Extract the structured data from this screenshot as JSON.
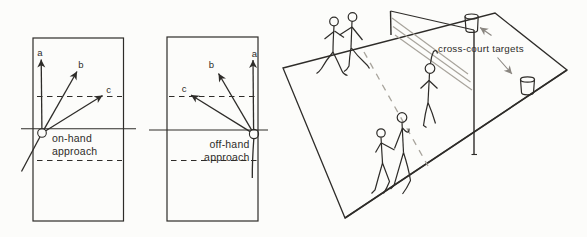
{
  "figure_type": "textbook court diagram",
  "palette": {
    "paper": "#fcfcfa",
    "ink": "#2e2c29",
    "soft_gray": "#a8a49c",
    "mid_gray": "#8a8680"
  },
  "on_hand_diagram": {
    "caption": [
      "on-hand",
      "approach"
    ],
    "arrow_labels": {
      "a": "a",
      "b": "b",
      "c": "c"
    }
  },
  "off_hand_diagram": {
    "caption": [
      "off-hand",
      "approach"
    ],
    "arrow_labels": {
      "a": "a",
      "b": "b",
      "c": "c"
    }
  },
  "court_scene": {
    "caption": "cross-court targets"
  }
}
